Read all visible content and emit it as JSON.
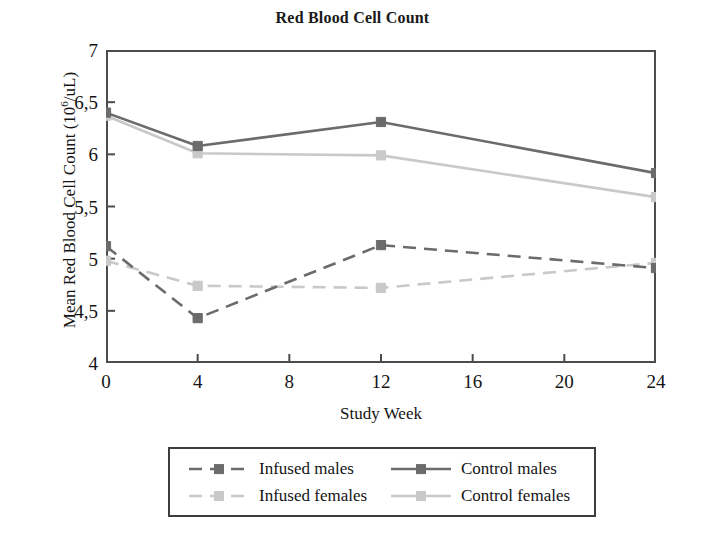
{
  "chart_data": {
    "type": "line",
    "title": "Red Blood Cell Count",
    "xlabel": "Study Week",
    "ylabel": "Mean Red Blood Cell Count (10⁶/uL)",
    "ylabel_prefix": "Mean Red Blood Cell Count (10",
    "ylabel_sup": "6",
    "ylabel_suffix": "/uL)",
    "x": [
      0,
      4,
      12,
      24
    ],
    "xlim": [
      0,
      24
    ],
    "ylim": [
      4,
      7
    ],
    "xticks": [
      "0",
      "4",
      "8",
      "12",
      "16",
      "20",
      "24"
    ],
    "xtick_values": [
      0,
      4,
      8,
      12,
      16,
      20,
      24
    ],
    "yticks": [
      "7",
      "6,5",
      "6",
      "5,5",
      "5",
      "4,5",
      "4"
    ],
    "ytick_values": [
      7,
      6.5,
      6,
      5.5,
      5,
      4.5,
      4
    ],
    "grid": false,
    "legend_position": "bottom",
    "decimal_separator": ",",
    "series": [
      {
        "name": "Infused males",
        "values": [
          5.12,
          4.43,
          5.13,
          4.91
        ],
        "color": "#6b6b6b",
        "style": "dashed",
        "marker": "square"
      },
      {
        "name": "Control males",
        "values": [
          6.4,
          6.08,
          6.31,
          5.82
        ],
        "color": "#6b6b6b",
        "style": "solid",
        "marker": "square"
      },
      {
        "name": "Infused females",
        "values": [
          4.98,
          4.74,
          4.72,
          4.96
        ],
        "color": "#c9c9c9",
        "style": "dashed",
        "marker": "square"
      },
      {
        "name": "Control females",
        "values": [
          6.37,
          6.01,
          5.99,
          5.59
        ],
        "color": "#c9c9c9",
        "style": "solid",
        "marker": "square"
      }
    ]
  },
  "legend": {
    "entries": [
      {
        "label": "Infused males"
      },
      {
        "label": "Control males"
      },
      {
        "label": "Infused females"
      },
      {
        "label": "Control females"
      }
    ]
  },
  "colors": {
    "axis": "#4c4c4c",
    "text": "#141414",
    "dark_series": "#6b6b6b",
    "light_series": "#c9c9c9",
    "background": "#ffffff"
  }
}
